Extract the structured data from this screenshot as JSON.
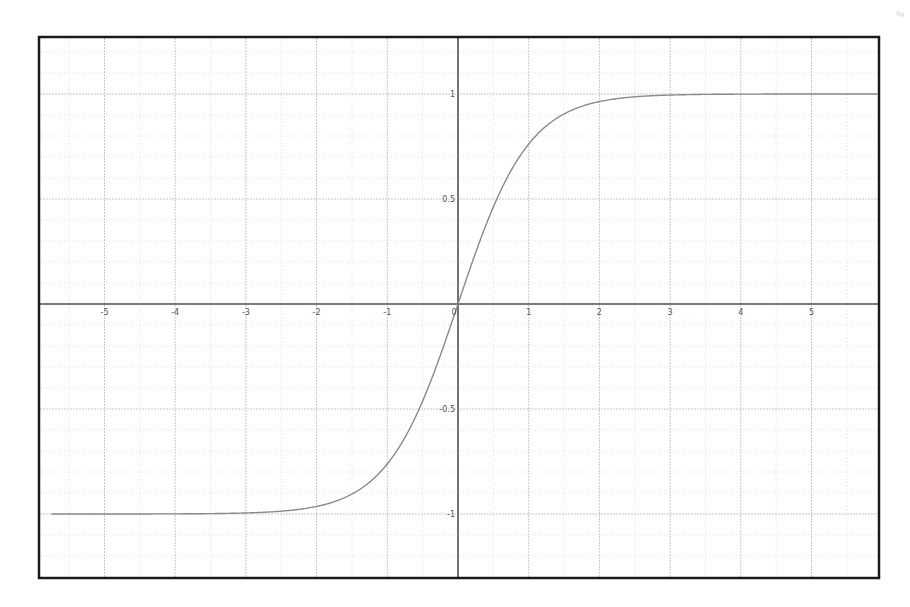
{
  "chart_data": {
    "type": "line",
    "title": "",
    "xlabel": "",
    "ylabel": "",
    "function": "tanh(x)",
    "xlim": [
      -5.75,
      6.15
    ],
    "ylim": [
      -1.31,
      1.28
    ],
    "grid": true,
    "legend": null,
    "x_ticks": [
      -5,
      -4,
      -3,
      -2,
      -1,
      0,
      1,
      2,
      3,
      4,
      5
    ],
    "x_tick_labels": [
      "-5",
      "-4",
      "-3",
      "-2",
      "-1",
      "0",
      "1",
      "2",
      "3",
      "4",
      "5"
    ],
    "y_ticks": [
      -1,
      -0.5,
      0.5,
      1
    ],
    "y_tick_labels": [
      "-1",
      "-0.5",
      "0.5",
      "1"
    ],
    "series": [
      {
        "name": "tanh(x)",
        "x": [
          -5.75,
          -5,
          -4,
          -3,
          -2.5,
          -2,
          -1.5,
          -1,
          -0.75,
          -0.5,
          -0.25,
          0,
          0.25,
          0.5,
          0.75,
          1,
          1.5,
          2,
          2.5,
          3,
          4,
          5,
          6.15
        ],
        "y": [
          -1.0,
          -0.9999,
          -0.9993,
          -0.9951,
          -0.9866,
          -0.964,
          -0.9051,
          -0.7616,
          -0.6351,
          -0.4621,
          -0.2449,
          0,
          0.2449,
          0.4621,
          0.6351,
          0.7616,
          0.9051,
          0.964,
          0.9866,
          0.9951,
          0.9993,
          0.9999,
          1.0
        ],
        "color": "#8a8a8a"
      }
    ],
    "colors": {
      "frame": "#1a1a1a",
      "axis": "#555555",
      "major_grid": "#c8c8c8",
      "minor_grid": "#e2e2e2",
      "curve": "#8a8a8a",
      "tick_label": "#555555"
    }
  },
  "corner_mark": "fig"
}
